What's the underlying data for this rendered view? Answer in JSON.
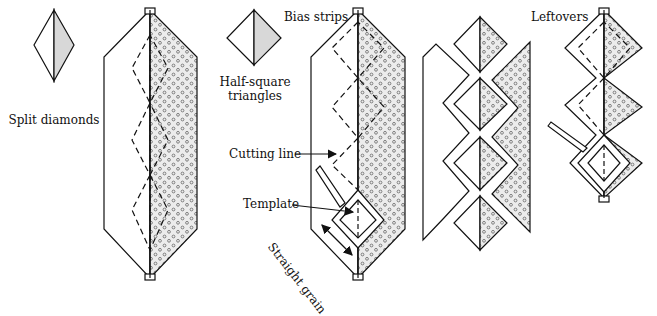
{
  "labels": {
    "split_diamonds": "Split diamonds",
    "half_square_1": "Half-square",
    "half_square_2": "triangles",
    "bias_strips": "Bias strips",
    "cutting_line": "Cutting line",
    "template": "Template",
    "straight_grain": "Straight grain",
    "leftovers": "Leftovers"
  },
  "colors": {
    "line": "#111111",
    "fabric_fill": "#e9e9e9",
    "dot": "#555555",
    "background": "#ffffff"
  },
  "panels": [
    {
      "id": "split-diamond-icon",
      "caption": "Split diamonds"
    },
    {
      "id": "bias-strips-with-diamond-cutting-lines"
    },
    {
      "id": "half-square-triangle-icon",
      "caption": "Half-square triangles"
    },
    {
      "id": "bias-strips-with-template",
      "captions": [
        "Bias strips",
        "Cutting line",
        "Template",
        "Straight grain"
      ]
    },
    {
      "id": "cut-diamonds-separated"
    },
    {
      "id": "leftovers-strip",
      "caption": "Leftovers"
    }
  ]
}
